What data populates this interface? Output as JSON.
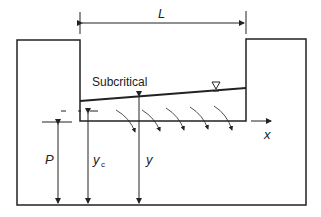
{
  "diagram": {
    "labels": {
      "length": "L",
      "regime": "Subcritical",
      "x_axis": "x",
      "weir_height": "P",
      "critical_depth": "y",
      "critical_depth_sub": "c",
      "depth": "y"
    },
    "symbols": {
      "water_surface": "water-surface-triangle"
    },
    "colors": {
      "line": "#222222",
      "background": "#ffffff"
    },
    "flow_arrows_count": 5
  }
}
